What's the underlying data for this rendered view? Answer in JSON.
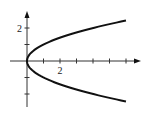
{
  "chart_data": {
    "type": "line",
    "title": "",
    "xlabel": "",
    "ylabel": "",
    "equation": "x = y^2",
    "series": [
      {
        "name": "x = y^2",
        "points": [
          [
            6.0,
            2.449
          ],
          [
            4.0,
            2.0
          ],
          [
            2.25,
            1.5
          ],
          [
            1.0,
            1.0
          ],
          [
            0.25,
            0.5
          ],
          [
            0.0,
            0.0
          ],
          [
            0.25,
            -0.5
          ],
          [
            1.0,
            -1.0
          ],
          [
            2.25,
            -1.5
          ],
          [
            4.0,
            -2.0
          ],
          [
            6.0,
            -2.449
          ]
        ]
      }
    ],
    "x_ticks": [
      1,
      2,
      3,
      4,
      5,
      6
    ],
    "y_ticks": [
      -2,
      -1,
      1,
      2
    ],
    "x_tick_labels": [
      {
        "value": 2,
        "label": "2"
      }
    ],
    "y_tick_labels": [
      {
        "value": 2,
        "label": "2"
      }
    ],
    "xlim": [
      -1,
      6.8
    ],
    "ylim": [
      -2.8,
      3.0
    ],
    "grid": false,
    "legend": null
  },
  "layout": {
    "origin_px": [
      27,
      61
    ],
    "unit_px": 16.5,
    "x_axis_px": [
      10,
      141
    ],
    "y_axis_px": [
      11,
      107
    ],
    "curve_color": "#111111",
    "axis_color": "#333333"
  }
}
